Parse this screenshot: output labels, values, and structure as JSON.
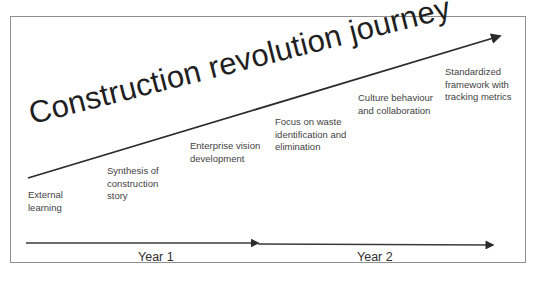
{
  "diagram": {
    "title": "Construction revolution journey",
    "steps": [
      {
        "label": "External\nlearning"
      },
      {
        "label": "Synthesis of\nconstruction\nstory"
      },
      {
        "label": "Enterprise vision\ndevelopment"
      },
      {
        "label": "Focus on waste\nidentification and\nelimination"
      },
      {
        "label": "Culture behaviour\nand collaboration"
      },
      {
        "label": "Standardized\nframework with\ntracking metrics"
      }
    ],
    "timeline": [
      {
        "label": "Year 1"
      },
      {
        "label": "Year 2"
      }
    ],
    "colors": {
      "line": "#2b2b2b",
      "frame": "#8f8f8f",
      "text": "#3f3f3f"
    }
  }
}
